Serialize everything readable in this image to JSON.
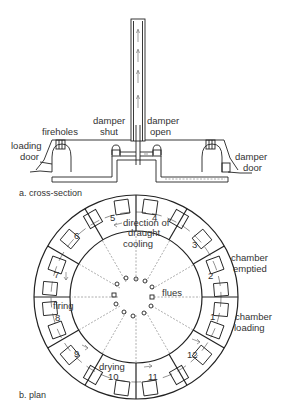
{
  "figure": {
    "cross_section": {
      "caption": "a. cross-section",
      "labels": {
        "fireholes": "fireholes",
        "loading_door_1": "loading",
        "loading_door_2": "door",
        "damper_shut_1": "damper",
        "damper_shut_2": "shut",
        "damper_open_1": "damper",
        "damper_open_2": "open",
        "damper_door_1": "damper",
        "damper_door_2": "door"
      }
    },
    "plan": {
      "caption": "b. plan",
      "chamber_numbers": [
        "1",
        "2",
        "3",
        "4",
        "5",
        "6",
        "7",
        "8",
        "9",
        "10",
        "11",
        "12"
      ],
      "labels": {
        "direction_1": "direction of",
        "direction_2": "draught",
        "cooling": "cooling",
        "chamber_emptied_1": "chamber",
        "chamber_emptied_2": "emptied",
        "flues": "flues",
        "chamber_loading_1": "chamber",
        "chamber_loading_2": "loading",
        "firing": "firing",
        "drying": "drying"
      }
    }
  },
  "colors": {
    "line": "#222222",
    "dashed": "#999999",
    "text": "#333333",
    "background": "#ffffff"
  }
}
